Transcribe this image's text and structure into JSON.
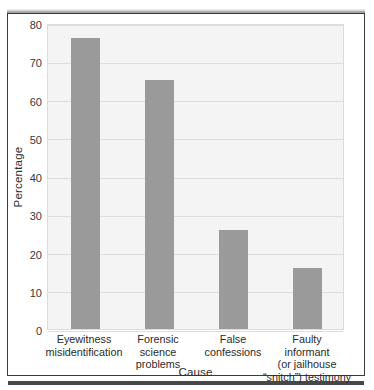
{
  "figure": {
    "background_color": "#ffffff",
    "frame_border_color": "#3b3b3b",
    "plot_background_color": "#f4f4f4",
    "grid_color": "#dddddd",
    "bar_color": "#9a9a9a",
    "text_color": "#2b2b2b"
  },
  "chart_data": {
    "type": "bar",
    "title": "",
    "xlabel": "Cause",
    "ylabel": "Percentage",
    "categories": [
      "Eyewitness misidentification",
      "Forensic science problems",
      "False confessions",
      "Faulty informant (or jailhouse “snitch”) testimony"
    ],
    "category_lines": [
      [
        "Eyewitness",
        "misidentification"
      ],
      [
        "Forensic",
        "science",
        "problems"
      ],
      [
        "False",
        "confessions"
      ],
      [
        "Faulty",
        "informant",
        "(or jailhouse",
        "“snitch”) testimony"
      ]
    ],
    "values": [
      76,
      65,
      26,
      16
    ],
    "ylim": [
      0,
      80
    ],
    "yticks": [
      0,
      10,
      20,
      30,
      40,
      50,
      60,
      70,
      80
    ],
    "ytick_labels": [
      "0",
      "10",
      "20",
      "30",
      "40",
      "50",
      "60",
      "70",
      "80"
    ],
    "grid": true,
    "grid_axis": "y",
    "legend": null,
    "legend_position": "none",
    "xlim_note": "4 categorical bars, evenly spaced"
  }
}
